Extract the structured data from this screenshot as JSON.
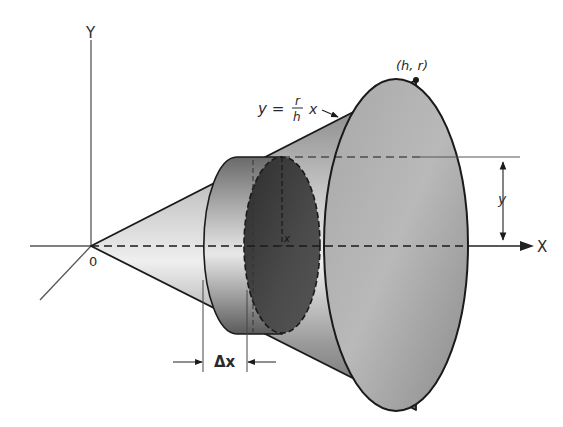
{
  "figure": {
    "labels": {
      "y_axis": "Y",
      "x_axis": "X",
      "origin": "0",
      "vertex_point": "(h, r)",
      "line_eq_lhs": "y =",
      "line_eq_num": "r",
      "line_eq_den": "h",
      "line_eq_var": "x",
      "radius": "y",
      "slice_position": "x",
      "slice_thickness": "Δx"
    },
    "colors": {
      "line": "#1a1a1a",
      "axis": "#555555",
      "cone_dark": "#6e6e6e",
      "cone_light": "#e6e6e6",
      "slice_face": "#3c3c3c",
      "background": "#ffffff"
    }
  }
}
